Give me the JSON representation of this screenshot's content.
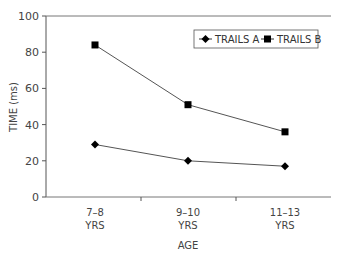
{
  "chart_data": {
    "type": "line",
    "title": "",
    "xlabel": "AGE",
    "ylabel": "TIME (ms)",
    "ylim": [
      0,
      100
    ],
    "yticks": [
      0,
      20,
      40,
      60,
      80,
      100
    ],
    "categories": [
      [
        "7–8",
        "YRS"
      ],
      [
        "9–10",
        "YRS"
      ],
      [
        "11–13",
        "YRS"
      ]
    ],
    "series": [
      {
        "name": "TRAILS A",
        "marker": "diamond",
        "values": [
          29,
          20,
          17
        ]
      },
      {
        "name": "TRAILS B",
        "marker": "square",
        "values": [
          84,
          51,
          36
        ]
      }
    ],
    "grid": false,
    "legend_position": "top-right"
  }
}
